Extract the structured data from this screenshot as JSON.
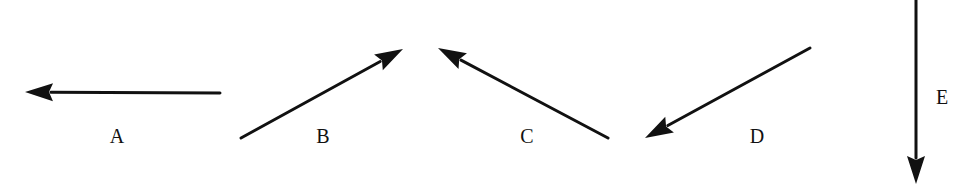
{
  "diagram": {
    "stroke_color": "#111111",
    "background": "#ffffff",
    "vectors": [
      {
        "id": "A",
        "label": "A",
        "direction": "left",
        "tail": [
          220,
          93
        ],
        "tip": [
          25,
          92
        ],
        "label_pos": [
          117,
          136
        ]
      },
      {
        "id": "B",
        "label": "B",
        "direction": "up-right",
        "tail": [
          241,
          138
        ],
        "tip": [
          403,
          49
        ],
        "label_pos": [
          323,
          136
        ]
      },
      {
        "id": "C",
        "label": "C",
        "direction": "up-left",
        "tail": [
          608,
          138
        ],
        "tip": [
          438,
          48
        ],
        "label_pos": [
          527,
          136
        ]
      },
      {
        "id": "D",
        "label": "D",
        "direction": "down-left",
        "tail": [
          810,
          48
        ],
        "tip": [
          645,
          138
        ],
        "label_pos": [
          757,
          136
        ]
      },
      {
        "id": "E",
        "label": "E",
        "direction": "down",
        "tail": [
          916,
          0
        ],
        "tip": [
          916,
          184
        ],
        "label_pos": [
          942,
          97
        ]
      }
    ]
  }
}
